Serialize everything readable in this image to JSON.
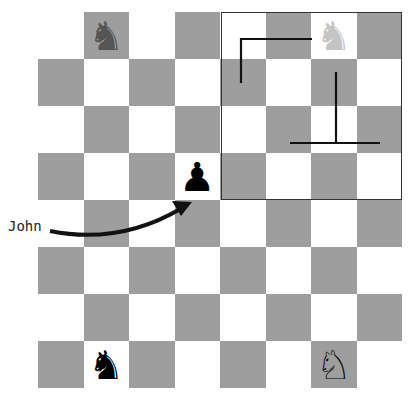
{
  "board": {
    "rows": 8,
    "cols": 8,
    "colors": {
      "dark": "#9e9e9e",
      "light": "#ffffff"
    },
    "pieces": [
      {
        "name": "knight-faded-dark",
        "glyph": "♞",
        "row": 0,
        "col": 1,
        "color": "#555555"
      },
      {
        "name": "knight-ghost-light",
        "glyph": "♞",
        "row": 0,
        "col": 6,
        "color": "#c4c4c4"
      },
      {
        "name": "pawn-black",
        "glyph": "♟",
        "row": 3,
        "col": 3,
        "color": "#000000"
      },
      {
        "name": "knight-black",
        "glyph": "♞",
        "row": 7,
        "col": 1,
        "color": "#000000"
      },
      {
        "name": "knight-white",
        "glyph": "♘",
        "row": 7,
        "col": 6,
        "color": "#000000"
      }
    ]
  },
  "annotation": {
    "label": "John"
  }
}
